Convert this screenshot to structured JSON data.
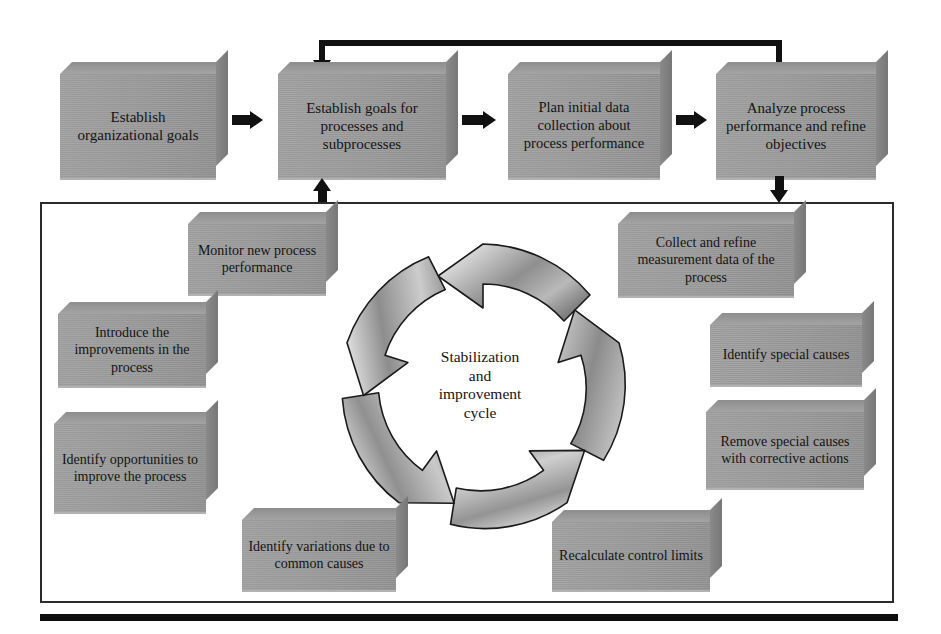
{
  "diagram": {
    "title": "Stabilization and improvement cycle",
    "colors": {
      "box_face": "#9b9b9b",
      "box_top": "#8d8d8d",
      "box_side": "#7d7d7d",
      "arrow": "#111111",
      "panel_border": "#2b2b2b",
      "background": "#ffffff",
      "text": "#141414"
    }
  },
  "top_row": {
    "boxes": [
      {
        "id": "establish-organizational-goals",
        "label": "Establish organizational goals"
      },
      {
        "id": "establish-goals-for-processes",
        "label": "Establish goals for processes and subprocesses"
      },
      {
        "id": "plan-initial-data-collection",
        "label": "Plan initial data collection about process performance"
      },
      {
        "id": "analyze-process-performance",
        "label": "Analyze process performance and refine objectives"
      }
    ]
  },
  "cycle": {
    "center_label_lines": [
      "Stabilization",
      "and",
      "improvement",
      "cycle"
    ],
    "arrow_count": 5,
    "direction": "clockwise"
  },
  "panel": {
    "boxes": [
      {
        "id": "monitor-new-process-performance",
        "label": "Monitor new process performance"
      },
      {
        "id": "collect-and-refine-measurement-data",
        "label": "Collect and refine measurement data of the process"
      },
      {
        "id": "introduce-the-improvements",
        "label": "Introduce the improvements in the process"
      },
      {
        "id": "identify-special-causes",
        "label": "Identify special causes"
      },
      {
        "id": "identify-opportunities-to-improve",
        "label": "Identify opportunities to improve the process"
      },
      {
        "id": "remove-special-causes",
        "label": "Remove special causes with corrective actions"
      },
      {
        "id": "identify-variations-common-causes",
        "label": "Identify variations due to common causes"
      },
      {
        "id": "recalculate-control-limits",
        "label": "Recalculate control limits"
      }
    ]
  }
}
